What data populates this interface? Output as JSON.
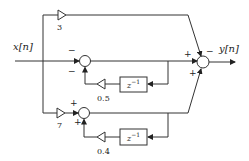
{
  "diagram": {
    "type": "signal-flow block diagram",
    "input_label": "x[n]",
    "output_label": "y[n]",
    "gains": {
      "top": "3",
      "bottom": "7",
      "feedback_upper": "0.5",
      "feedback_lower": "0.4"
    },
    "delay_label": "z",
    "delay_exponent": "−1",
    "signs": {
      "summer1_left": "−",
      "summer1_bottom": "−",
      "summer2_top": "+",
      "summer2_bottom": "+",
      "out_left": "+",
      "out_top": "−",
      "out_bottom": "+"
    }
  }
}
